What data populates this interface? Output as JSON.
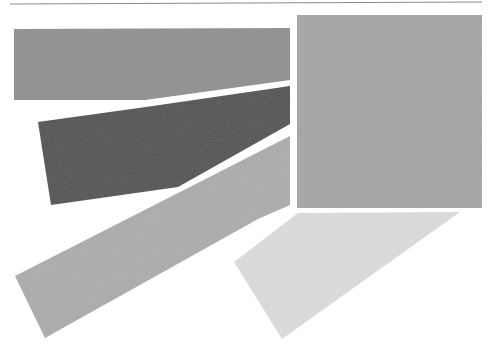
{
  "figure": {
    "width": 492,
    "height": 349,
    "background": "#ffffff",
    "top_rule": {
      "x1": 10,
      "y1": 4,
      "x2": 482,
      "y2": 2,
      "color": "#8a8a8a",
      "width": 1.2
    },
    "shapes": [
      {
        "id": "shape-top-left-band",
        "label": "medium gray band",
        "fill": "#8f8f8f",
        "points": "14,29 290,28 290,80 145,100 14,100"
      },
      {
        "id": "shape-dark-wedge",
        "label": "dark gray wedge",
        "fill": "#4b4b4b",
        "points": "38,122 146,107 290,86 290,124 178,187 51,205"
      },
      {
        "id": "shape-diagonal-band",
        "label": "light gray diagonal band",
        "fill": "#acacac",
        "points": "15,276 290,136 290,205 258,219 45,338"
      },
      {
        "id": "shape-square",
        "label": "gray square",
        "fill": "#a6a6a6",
        "points": "297,15 482,15 482,208 297,208"
      },
      {
        "id": "shape-bottom-light",
        "label": "very light gray trapezoid",
        "fill": "#dddddd",
        "points": "234,262 298,213 460,212 282,339"
      }
    ]
  }
}
